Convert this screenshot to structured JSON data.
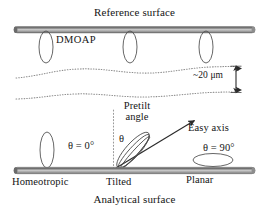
{
  "figure": {
    "type": "schematic-diagram",
    "background_color": "#ffffff"
  },
  "labels": {
    "reference_surface": "Reference surface",
    "dmoap": "DMOAP",
    "gap_thickness": "~20 μm",
    "pretilt_line1": "Pretilt",
    "pretilt_line2": "angle",
    "theta_symbol": "θ",
    "easy_axis": "Easy axis",
    "theta_zero": "θ = 0°",
    "theta_ninety": "θ = 90°",
    "homeotropic": "Homeotropic",
    "tilted": "Tilted",
    "planar": "Planar",
    "analytical_surface": "Analytical surface"
  },
  "colors": {
    "bar_dark": "#6f6f6f",
    "bar_mid": "#b9b9b9",
    "bar_light": "#d8d8d8",
    "outline": "#4a4a4a",
    "dotted": "#8a8a8a",
    "text": "#141414",
    "arrow": "#2b2b2b"
  },
  "geometry": {
    "width": 269,
    "height": 217,
    "reference_surface_y": 27,
    "analytical_surface_y": 170,
    "surface_x_start": 14,
    "surface_x_end": 255,
    "gap_label_x": 193,
    "dimension_arrow_x": 236,
    "dimension_arrow_top_y": 66,
    "dimension_arrow_bottom_y": 92
  },
  "elements": {
    "top_ellipses": [
      {
        "name": "dmoap-ellipse-left",
        "cx": 46,
        "cy": 47,
        "rx": 7,
        "ry": 16,
        "rotate": 0
      },
      {
        "name": "dmoap-ellipse-middle",
        "cx": 130,
        "cy": 47,
        "rx": 7,
        "ry": 16,
        "rotate": 0
      },
      {
        "name": "dmoap-ellipse-right",
        "cx": 206,
        "cy": 47,
        "rx": 7,
        "ry": 16,
        "rotate": 0
      }
    ],
    "bottom_ellipses": [
      {
        "name": "homeotropic-ellipse",
        "cx": 47,
        "cy": 151,
        "rx": 7,
        "ry": 17,
        "rotate": 0
      },
      {
        "name": "tilted-ellipse",
        "cx": 133,
        "cy": 151,
        "rx": 22,
        "ry": 7,
        "rotate": -48
      },
      {
        "name": "planar-ellipse",
        "cx": 213,
        "cy": 160,
        "rx": 20,
        "ry": 7,
        "rotate": 0
      }
    ],
    "easy_axis_arrow": {
      "x1": 115,
      "y1": 170,
      "x2": 196,
      "y2": 119
    },
    "vertical_reference_dotted": {
      "x": 113,
      "y1": 112,
      "y2": 170
    },
    "wavy_dotted_lines": [
      {
        "name": "interface-upper",
        "y_base": 73
      },
      {
        "name": "interface-lower",
        "y_base": 98
      }
    ]
  }
}
